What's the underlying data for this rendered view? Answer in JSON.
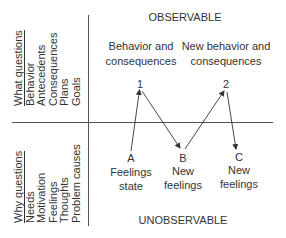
{
  "regions": {
    "top": "OBSERVABLE",
    "bottom": "UNOBSERVABLE"
  },
  "what_column": {
    "heading": "What questions",
    "items": [
      "Behavior",
      "Antecedents",
      "Consequences",
      "Plans",
      "Goals"
    ]
  },
  "why_column": {
    "heading": "Why questions",
    "items": [
      "Needs",
      "Motivation",
      "Feelings",
      "Thoughts",
      "Problem causes"
    ]
  },
  "nodes": {
    "n1": {
      "marker": "1",
      "line1": "Behavior and",
      "line2": "consequences"
    },
    "n2": {
      "marker": "2",
      "line1": "New behavior and",
      "line2": "consequences"
    },
    "a": {
      "marker": "A",
      "line1": "Feelings",
      "line2": "state"
    },
    "b": {
      "marker": "B",
      "line1": "New",
      "line2": "feelings"
    },
    "c": {
      "marker": "C",
      "line1": "New",
      "line2": "feelings"
    }
  },
  "edges": [
    {
      "from": "A",
      "to": "1"
    },
    {
      "from": "1",
      "to": "B"
    },
    {
      "from": "B",
      "to": "2"
    },
    {
      "from": "2",
      "to": "C"
    }
  ],
  "colors": {
    "line": "#444444",
    "text": "#333333",
    "background": "#ffffff"
  }
}
